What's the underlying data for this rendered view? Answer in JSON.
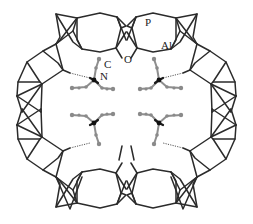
{
  "figure": {
    "type": "crystal-structure-diagram",
    "description_labels": {
      "phosphorus": "P",
      "aluminum": "Al",
      "oxygen": "O",
      "carbon": "C",
      "nitrogen": "N"
    },
    "colors": {
      "framework": "#2b2b2b",
      "template_carbon": "#8e8e8e",
      "template_nitrogen": "#111111",
      "background": "#ffffff"
    },
    "template_molecule_count": 4
  }
}
